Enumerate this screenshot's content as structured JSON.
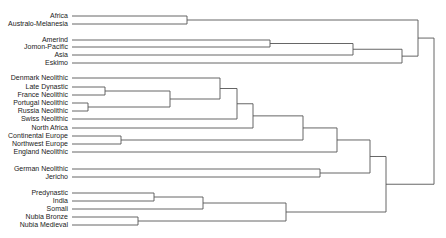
{
  "diagram": {
    "type": "dendrogram",
    "orientation": "leaves-left",
    "colors": {
      "line": "#555555",
      "text": "#222222",
      "background": "#ffffff"
    },
    "label_right_x": 68,
    "leaf_line_start_x": 72,
    "leaves": [
      {
        "id": "africa",
        "label": "Africa",
        "y": 16
      },
      {
        "id": "australo",
        "label": "Australo-Melanesia",
        "y": 24
      },
      {
        "id": "amerind",
        "label": "Amerind",
        "y": 40
      },
      {
        "id": "jomon",
        "label": "Jomon-Pacific",
        "y": 47
      },
      {
        "id": "asia",
        "label": "Asia",
        "y": 55
      },
      {
        "id": "eskimo",
        "label": "Eskimo",
        "y": 63
      },
      {
        "id": "denmark",
        "label": "Denmark Neolithic",
        "y": 78
      },
      {
        "id": "latedyn",
        "label": "Late Dynastic",
        "y": 87
      },
      {
        "id": "france",
        "label": "France Neolithic",
        "y": 95
      },
      {
        "id": "portugal",
        "label": "Portugal Neolithic",
        "y": 103
      },
      {
        "id": "russia",
        "label": "Russia Neolithic",
        "y": 111
      },
      {
        "id": "swiss",
        "label": "Swiss Neolithic",
        "y": 119
      },
      {
        "id": "nafrica",
        "label": "North Africa",
        "y": 128
      },
      {
        "id": "conteur",
        "label": "Continental Europe",
        "y": 136
      },
      {
        "id": "nweur",
        "label": "Northwest Europe",
        "y": 144
      },
      {
        "id": "england",
        "label": "England Neolithic",
        "y": 152
      },
      {
        "id": "german",
        "label": "German Neolithic",
        "y": 169
      },
      {
        "id": "jericho",
        "label": "Jericho",
        "y": 177
      },
      {
        "id": "predyn",
        "label": "Predynastic",
        "y": 193
      },
      {
        "id": "india",
        "label": "India",
        "y": 201
      },
      {
        "id": "somali",
        "label": "Somali",
        "y": 209
      },
      {
        "id": "nubiab",
        "label": "Nubia Bronze",
        "y": 217
      },
      {
        "id": "nubiam",
        "label": "Nubia Medieval",
        "y": 225
      }
    ],
    "nodes": [
      {
        "id": "n_afr",
        "x": 187,
        "children": [
          "africa",
          "australo"
        ]
      },
      {
        "id": "n_amj",
        "x": 270,
        "children": [
          "amerind",
          "jomon"
        ]
      },
      {
        "id": "n_asia",
        "x": 353,
        "children": [
          "n_amj",
          "asia"
        ]
      },
      {
        "id": "n_esk",
        "x": 402,
        "children": [
          "n_asia",
          "eskimo"
        ]
      },
      {
        "id": "n_top",
        "x": 418,
        "children": [
          "n_afr",
          "n_esk"
        ]
      },
      {
        "id": "n_ldf",
        "x": 105,
        "children": [
          "latedyn",
          "france"
        ]
      },
      {
        "id": "n_pr",
        "x": 88,
        "children": [
          "portugal",
          "russia"
        ]
      },
      {
        "id": "n_ldfpr",
        "x": 170,
        "children": [
          "n_ldf",
          "n_pr"
        ]
      },
      {
        "id": "n_den",
        "x": 220,
        "children": [
          "denmark",
          "n_ldfpr"
        ]
      },
      {
        "id": "n_swiss",
        "x": 237,
        "children": [
          "n_den",
          "swiss"
        ]
      },
      {
        "id": "n_naf",
        "x": 253,
        "children": [
          "n_swiss",
          "nafrica"
        ]
      },
      {
        "id": "n_cnw",
        "x": 121,
        "children": [
          "conteur",
          "nweur"
        ]
      },
      {
        "id": "n_eur",
        "x": 303,
        "children": [
          "n_naf",
          "n_cnw"
        ]
      },
      {
        "id": "n_eng",
        "x": 337,
        "children": [
          "n_eur",
          "england"
        ]
      },
      {
        "id": "n_gj",
        "x": 320,
        "children": [
          "german",
          "jericho"
        ]
      },
      {
        "id": "n_mid",
        "x": 370,
        "children": [
          "n_eng",
          "n_gj"
        ]
      },
      {
        "id": "n_pi",
        "x": 154,
        "children": [
          "predyn",
          "india"
        ]
      },
      {
        "id": "n_pis",
        "x": 203,
        "children": [
          "n_pi",
          "somali"
        ]
      },
      {
        "id": "n_nub",
        "x": 138,
        "children": [
          "nubiab",
          "nubiam"
        ]
      },
      {
        "id": "n_afrc",
        "x": 286,
        "children": [
          "n_pis",
          "n_nub"
        ]
      },
      {
        "id": "n_low",
        "x": 386,
        "children": [
          "n_mid",
          "n_afrc"
        ]
      },
      {
        "id": "root",
        "x": 434,
        "children": [
          "n_top",
          "n_low"
        ]
      }
    ]
  }
}
